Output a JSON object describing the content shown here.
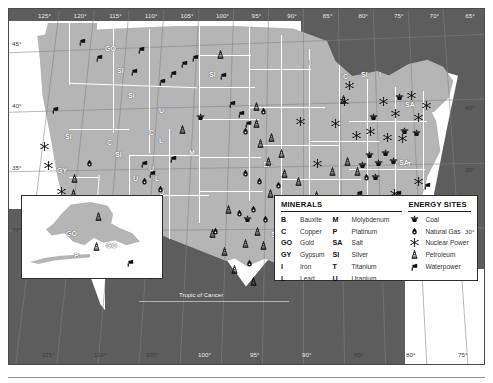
{
  "map": {
    "title": "United States Mineral and Energy Resources",
    "tropic_label": "Tropic of Cancer",
    "longitude_top": [
      "125°",
      "120°",
      "115°",
      "110°",
      "105°",
      "100°",
      "95°",
      "90°",
      "85°",
      "80°",
      "75°",
      "70°",
      "65°"
    ],
    "longitude_bottom": [
      "115°",
      "110°",
      "105°",
      "100°",
      "95°",
      "90°",
      "85°",
      "80°",
      "75°"
    ],
    "latitude_left": [
      "45°",
      "40°",
      "35°",
      "30°"
    ],
    "latitude_right": [
      "40°",
      "35°",
      "30°"
    ],
    "colors": {
      "land": "#b5b5b5",
      "water": "#5d5d5d",
      "border": "#2e2e2e",
      "state_line": "#ffffff",
      "label_text": "#ffffff",
      "symbol": "#111111"
    }
  },
  "legend": {
    "minerals": {
      "heading": "MINERALS",
      "col1": [
        {
          "code": "B",
          "name": "Bauxite"
        },
        {
          "code": "C",
          "name": "Copper"
        },
        {
          "code": "GO",
          "name": "Gold"
        },
        {
          "code": "GY",
          "name": "Gypsum"
        },
        {
          "code": "I",
          "name": "Iron"
        },
        {
          "code": "L",
          "name": "Lead"
        }
      ],
      "col2": [
        {
          "code": "M",
          "name": "Molybdenum"
        },
        {
          "code": "P",
          "name": "Platinum"
        },
        {
          "code": "SA",
          "name": "Salt"
        },
        {
          "code": "SI",
          "name": "Silver"
        },
        {
          "code": "T",
          "name": "Titanium"
        },
        {
          "code": "U",
          "name": "Uranium"
        }
      ]
    },
    "energy": {
      "heading": "ENERGY SITES",
      "items": [
        {
          "icon": "coal-icon",
          "name": "Coal"
        },
        {
          "icon": "natural-gas-icon",
          "name": "Natural Gas"
        },
        {
          "icon": "nuclear-power-icon",
          "name": "Nuclear Power"
        },
        {
          "icon": "petroleum-icon",
          "name": "Petroleum"
        },
        {
          "icon": "waterpower-icon",
          "name": "Waterpower"
        }
      ]
    }
  },
  "alaska_inset": {
    "mineral_labels": [
      {
        "code": "GO",
        "x": 44,
        "y": 34
      },
      {
        "code": "GO",
        "x": 84,
        "y": 46
      },
      {
        "code": "P",
        "x": 52,
        "y": 56
      }
    ],
    "energy_symbols": [
      {
        "icon": "petroleum-icon",
        "x": 72,
        "y": 16
      },
      {
        "icon": "petroleum-icon",
        "x": 70,
        "y": 46
      },
      {
        "icon": "waterpower-icon",
        "x": 104,
        "y": 62
      }
    ]
  },
  "mineral_labels": [
    {
      "code": "GO",
      "x": 96,
      "y": 36
    },
    {
      "code": "SI",
      "x": 108,
      "y": 58
    },
    {
      "code": "SI",
      "x": 119,
      "y": 83
    },
    {
      "code": "SI",
      "x": 56,
      "y": 124
    },
    {
      "code": "GY",
      "x": 48,
      "y": 158
    },
    {
      "code": "SI",
      "x": 38,
      "y": 187
    },
    {
      "code": "C",
      "x": 98,
      "y": 130
    },
    {
      "code": "SI",
      "x": 106,
      "y": 142
    },
    {
      "code": "C",
      "x": 140,
      "y": 120
    },
    {
      "code": "L",
      "x": 150,
      "y": 128
    },
    {
      "code": "C",
      "x": 86,
      "y": 198
    },
    {
      "code": "C",
      "x": 106,
      "y": 198
    },
    {
      "code": "SI",
      "x": 112,
      "y": 210
    },
    {
      "code": "C",
      "x": 130,
      "y": 200
    },
    {
      "code": "U",
      "x": 140,
      "y": 156
    },
    {
      "code": "L",
      "x": 146,
      "y": 166
    },
    {
      "code": "U",
      "x": 150,
      "y": 180
    },
    {
      "code": "U",
      "x": 124,
      "y": 166
    },
    {
      "code": "U",
      "x": 150,
      "y": 98
    },
    {
      "code": "M",
      "x": 180,
      "y": 140
    },
    {
      "code": "SI",
      "x": 200,
      "y": 62
    },
    {
      "code": "I",
      "x": 300,
      "y": 50
    },
    {
      "code": "C",
      "x": 334,
      "y": 64
    },
    {
      "code": "I",
      "x": 341,
      "y": 72
    },
    {
      "code": "SI",
      "x": 352,
      "y": 62
    },
    {
      "code": "SA",
      "x": 254,
      "y": 152
    },
    {
      "code": "SA",
      "x": 262,
      "y": 222
    },
    {
      "code": "SA",
      "x": 306,
      "y": 240
    },
    {
      "code": "SA",
      "x": 396,
      "y": 92
    },
    {
      "code": "SA",
      "x": 390,
      "y": 150
    },
    {
      "code": "B",
      "x": 289,
      "y": 186
    },
    {
      "code": "I",
      "x": 318,
      "y": 200
    },
    {
      "code": "T",
      "x": 398,
      "y": 152
    },
    {
      "code": "T",
      "x": 355,
      "y": 237
    },
    {
      "code": "I",
      "x": 370,
      "y": 62
    }
  ],
  "energy_symbols": [
    {
      "icon": "waterpower-icon",
      "x": 69,
      "y": 28
    },
    {
      "icon": "waterpower-icon",
      "x": 86,
      "y": 44
    },
    {
      "icon": "waterpower-icon",
      "x": 128,
      "y": 36
    },
    {
      "icon": "waterpower-icon",
      "x": 121,
      "y": 58
    },
    {
      "icon": "waterpower-icon",
      "x": 149,
      "y": 68
    },
    {
      "icon": "waterpower-icon",
      "x": 160,
      "y": 60
    },
    {
      "icon": "waterpower-icon",
      "x": 171,
      "y": 50
    },
    {
      "icon": "waterpower-icon",
      "x": 182,
      "y": 44
    },
    {
      "icon": "waterpower-icon",
      "x": 42,
      "y": 96
    },
    {
      "icon": "waterpower-icon",
      "x": 131,
      "y": 150
    },
    {
      "icon": "waterpower-icon",
      "x": 139,
      "y": 160
    },
    {
      "icon": "waterpower-icon",
      "x": 160,
      "y": 145
    },
    {
      "icon": "waterpower-icon",
      "x": 210,
      "y": 62
    },
    {
      "icon": "waterpower-icon",
      "x": 219,
      "y": 90
    },
    {
      "icon": "waterpower-icon",
      "x": 228,
      "y": 100
    },
    {
      "icon": "waterpower-icon",
      "x": 235,
      "y": 110
    },
    {
      "icon": "waterpower-icon",
      "x": 333,
      "y": 185
    },
    {
      "icon": "waterpower-icon",
      "x": 346,
      "y": 180
    },
    {
      "icon": "waterpower-icon",
      "x": 385,
      "y": 180
    },
    {
      "icon": "waterpower-icon",
      "x": 414,
      "y": 172
    },
    {
      "icon": "nuclear-power-icon",
      "x": 31,
      "y": 133
    },
    {
      "icon": "nuclear-power-icon",
      "x": 35,
      "y": 152
    },
    {
      "icon": "nuclear-power-icon",
      "x": 48,
      "y": 178
    },
    {
      "icon": "nuclear-power-icon",
      "x": 331,
      "y": 88
    },
    {
      "icon": "nuclear-power-icon",
      "x": 336,
      "y": 72
    },
    {
      "icon": "nuclear-power-icon",
      "x": 370,
      "y": 88
    },
    {
      "icon": "nuclear-power-icon",
      "x": 382,
      "y": 100
    },
    {
      "icon": "nuclear-power-icon",
      "x": 398,
      "y": 82
    },
    {
      "icon": "nuclear-power-icon",
      "x": 405,
      "y": 104
    },
    {
      "icon": "nuclear-power-icon",
      "x": 413,
      "y": 92
    },
    {
      "icon": "nuclear-power-icon",
      "x": 343,
      "y": 122
    },
    {
      "icon": "nuclear-power-icon",
      "x": 357,
      "y": 118
    },
    {
      "icon": "nuclear-power-icon",
      "x": 374,
      "y": 124
    },
    {
      "icon": "nuclear-power-icon",
      "x": 389,
      "y": 125
    },
    {
      "icon": "nuclear-power-icon",
      "x": 304,
      "y": 150
    },
    {
      "icon": "nuclear-power-icon",
      "x": 381,
      "y": 180
    },
    {
      "icon": "nuclear-power-icon",
      "x": 392,
      "y": 191
    },
    {
      "icon": "nuclear-power-icon",
      "x": 405,
      "y": 168
    },
    {
      "icon": "nuclear-power-icon",
      "x": 322,
      "y": 110
    },
    {
      "icon": "nuclear-power-icon",
      "x": 287,
      "y": 108
    },
    {
      "icon": "coal-icon",
      "x": 187,
      "y": 104
    },
    {
      "icon": "coal-icon",
      "x": 234,
      "y": 206
    },
    {
      "icon": "coal-icon",
      "x": 303,
      "y": 224
    },
    {
      "icon": "coal-icon",
      "x": 360,
      "y": 104
    },
    {
      "icon": "coal-icon",
      "x": 349,
      "y": 152
    },
    {
      "icon": "coal-icon",
      "x": 356,
      "y": 142
    },
    {
      "icon": "coal-icon",
      "x": 365,
      "y": 150
    },
    {
      "icon": "coal-icon",
      "x": 372,
      "y": 140
    },
    {
      "icon": "coal-icon",
      "x": 380,
      "y": 148
    },
    {
      "icon": "coal-icon",
      "x": 362,
      "y": 164
    },
    {
      "icon": "coal-icon",
      "x": 386,
      "y": 84
    },
    {
      "icon": "coal-icon",
      "x": 340,
      "y": 186
    },
    {
      "icon": "coal-icon",
      "x": 327,
      "y": 196
    },
    {
      "icon": "coal-icon",
      "x": 391,
      "y": 118
    },
    {
      "icon": "coal-icon",
      "x": 403,
      "y": 120
    },
    {
      "icon": "petroleum-icon",
      "x": 61,
      "y": 165
    },
    {
      "icon": "petroleum-icon",
      "x": 60,
      "y": 180
    },
    {
      "icon": "petroleum-icon",
      "x": 169,
      "y": 116
    },
    {
      "icon": "petroleum-icon",
      "x": 243,
      "y": 93
    },
    {
      "icon": "petroleum-icon",
      "x": 207,
      "y": 41
    },
    {
      "icon": "petroleum-icon",
      "x": 247,
      "y": 130
    },
    {
      "icon": "petroleum-icon",
      "x": 215,
      "y": 196
    },
    {
      "icon": "petroleum-icon",
      "x": 199,
      "y": 220
    },
    {
      "icon": "petroleum-icon",
      "x": 211,
      "y": 238
    },
    {
      "icon": "petroleum-icon",
      "x": 232,
      "y": 230
    },
    {
      "icon": "petroleum-icon",
      "x": 244,
      "y": 218
    },
    {
      "icon": "petroleum-icon",
      "x": 250,
      "y": 232
    },
    {
      "icon": "petroleum-icon",
      "x": 264,
      "y": 236
    },
    {
      "icon": "petroleum-icon",
      "x": 221,
      "y": 256
    },
    {
      "icon": "petroleum-icon",
      "x": 240,
      "y": 268
    },
    {
      "icon": "petroleum-icon",
      "x": 289,
      "y": 218
    },
    {
      "icon": "petroleum-icon",
      "x": 300,
      "y": 230
    },
    {
      "icon": "petroleum-icon",
      "x": 313,
      "y": 200
    },
    {
      "icon": "petroleum-icon",
      "x": 330,
      "y": 218
    },
    {
      "icon": "petroleum-icon",
      "x": 290,
      "y": 196
    },
    {
      "icon": "petroleum-icon",
      "x": 303,
      "y": 182
    },
    {
      "icon": "petroleum-icon",
      "x": 285,
      "y": 168
    },
    {
      "icon": "petroleum-icon",
      "x": 271,
      "y": 160
    },
    {
      "icon": "petroleum-icon",
      "x": 257,
      "y": 180
    },
    {
      "icon": "petroleum-icon",
      "x": 319,
      "y": 158
    },
    {
      "icon": "petroleum-icon",
      "x": 334,
      "y": 148
    },
    {
      "icon": "petroleum-icon",
      "x": 344,
      "y": 158
    },
    {
      "icon": "petroleum-icon",
      "x": 243,
      "y": 110
    },
    {
      "icon": "petroleum-icon",
      "x": 258,
      "y": 124
    },
    {
      "icon": "petroleum-icon",
      "x": 255,
      "y": 148
    },
    {
      "icon": "petroleum-icon",
      "x": 268,
      "y": 140
    },
    {
      "icon": "petroleum-icon",
      "x": 330,
      "y": 86
    },
    {
      "icon": "natural-gas-icon",
      "x": 76,
      "y": 150
    },
    {
      "icon": "natural-gas-icon",
      "x": 147,
      "y": 176
    },
    {
      "icon": "natural-gas-icon",
      "x": 131,
      "y": 168
    },
    {
      "icon": "natural-gas-icon",
      "x": 202,
      "y": 218
    },
    {
      "icon": "natural-gas-icon",
      "x": 226,
      "y": 200
    },
    {
      "icon": "natural-gas-icon",
      "x": 240,
      "y": 196
    },
    {
      "icon": "natural-gas-icon",
      "x": 252,
      "y": 206
    },
    {
      "icon": "natural-gas-icon",
      "x": 236,
      "y": 250
    },
    {
      "icon": "natural-gas-icon",
      "x": 280,
      "y": 210
    },
    {
      "icon": "natural-gas-icon",
      "x": 274,
      "y": 190
    },
    {
      "icon": "natural-gas-icon",
      "x": 265,
      "y": 172
    },
    {
      "icon": "natural-gas-icon",
      "x": 246,
      "y": 168
    },
    {
      "icon": "natural-gas-icon",
      "x": 232,
      "y": 160
    },
    {
      "icon": "natural-gas-icon",
      "x": 232,
      "y": 118
    },
    {
      "icon": "natural-gas-icon",
      "x": 250,
      "y": 98
    },
    {
      "icon": "natural-gas-icon",
      "x": 320,
      "y": 190
    },
    {
      "icon": "natural-gas-icon",
      "x": 353,
      "y": 164
    }
  ]
}
